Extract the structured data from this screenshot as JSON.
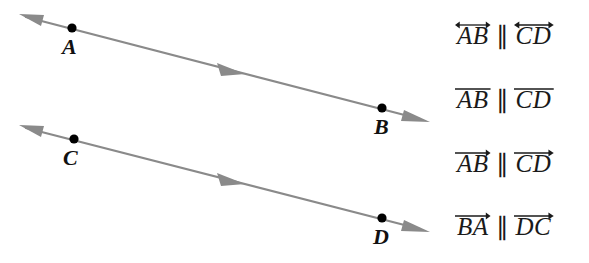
{
  "figure": {
    "background_color": "#ffffff",
    "line_color": "#8a8a8a",
    "dot_color": "#000000",
    "label_color": "#111111"
  },
  "diagram": {
    "name": "two-parallel-lines-diagram",
    "lines": [
      {
        "id": "line-ab",
        "label": "line AB",
        "start_arrow": "left-arrowhead",
        "end_arrow": "right-arrowhead",
        "mid_arrow": "right-direction-marker",
        "x1": 20,
        "y1": 15,
        "x2": 428,
        "y2": 120,
        "mid_marker_x": 232,
        "mid_marker_y": 70
      },
      {
        "id": "line-cd",
        "label": "line CD",
        "start_arrow": "left-arrowhead",
        "end_arrow": "right-arrowhead",
        "mid_arrow": "right-direction-marker",
        "x1": 20,
        "y1": 125,
        "x2": 428,
        "y2": 230,
        "mid_marker_x": 232,
        "mid_marker_y": 180
      }
    ],
    "points": [
      {
        "id": "point-a",
        "label": "A",
        "dot_x": 72,
        "dot_y": 28,
        "label_x": 63,
        "label_y": 38
      },
      {
        "id": "point-b",
        "label": "B",
        "dot_x": 382,
        "dot_y": 108,
        "label_x": 375,
        "label_y": 117
      },
      {
        "id": "point-c",
        "label": "C",
        "dot_x": 74,
        "dot_y": 139,
        "label_x": 64,
        "label_y": 148
      },
      {
        "id": "point-d",
        "label": "D",
        "dot_x": 382,
        "dot_y": 218,
        "label_x": 374,
        "label_y": 227
      }
    ]
  },
  "answer_options": {
    "name": "answer-choice-list",
    "parallel_symbol": "∥",
    "items": [
      {
        "id": "option-1",
        "top": 14,
        "left_term": "AB",
        "right_term": "CD",
        "left_accent": "double-arrow",
        "right_accent": "double-arrow",
        "reading": "line AB parallel to line CD"
      },
      {
        "id": "option-2",
        "top": 78,
        "left_term": "AB",
        "right_term": "CD",
        "left_accent": "bar",
        "right_accent": "bar",
        "reading": "segment AB parallel to segment CD"
      },
      {
        "id": "option-3",
        "top": 142,
        "left_term": "AB",
        "right_term": "CD",
        "left_accent": "right-arrow",
        "right_accent": "right-arrow",
        "reading": "ray AB parallel to ray CD"
      },
      {
        "id": "option-4",
        "top": 205,
        "left_term": "BA",
        "right_term": "DC",
        "left_accent": "right-arrow",
        "right_accent": "right-arrow",
        "reading": "ray BA parallel to ray DC"
      }
    ]
  }
}
